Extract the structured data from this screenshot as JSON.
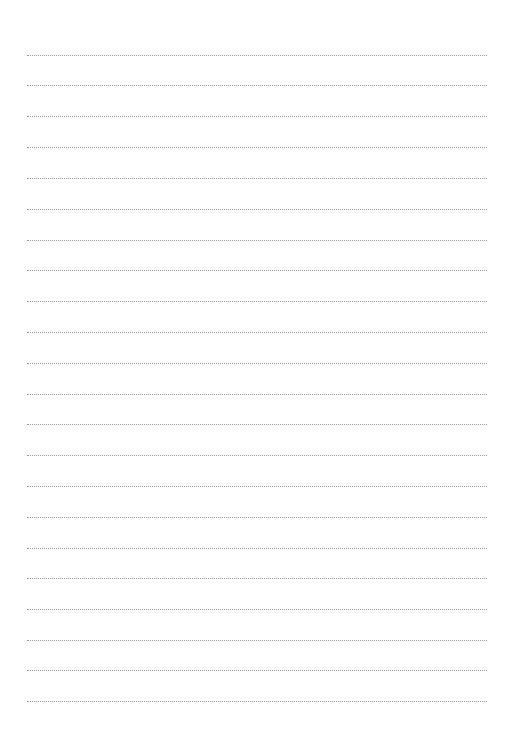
{
  "page": {
    "type": "lined-paper",
    "background_color": "#ffffff",
    "line_color": "#9a9a9a",
    "line_style": "dotted",
    "line_left_x": 27,
    "line_right_x": 487,
    "line_count": 22,
    "line_positions_y": [
      55,
      85,
      116,
      147,
      178,
      209,
      240,
      270,
      301,
      332,
      363,
      394,
      424,
      455,
      486,
      517,
      548,
      578,
      609,
      640,
      670,
      701
    ]
  }
}
